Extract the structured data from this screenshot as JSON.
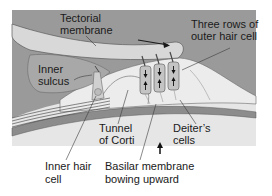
{
  "figure": {
    "colors": {
      "background_field": "#9a9a9a",
      "tectorial_membrane": "#d8d8d8",
      "inner_sulcus": "#a8a8a8",
      "organ_tissue": "#e6e6e6",
      "basilar_membrane": "#8c8c8c",
      "hair_cell": "#c4c4c4",
      "outline": "#5a5a5a",
      "page": "#ffffff",
      "text": "#1a1a1a"
    }
  },
  "labels": {
    "tectorial_membrane": [
      "Tectorial",
      "membrane"
    ],
    "inner_sulcus": [
      "Inner",
      "sulcus"
    ],
    "outer_hair_cells": [
      "Three rows of",
      "outer hair cell"
    ],
    "tunnel_of_corti": [
      "Tunnel",
      "of Corti"
    ],
    "deiters_cells": [
      "Deiter’s",
      "cells"
    ],
    "inner_hair_cell": [
      "Inner hair",
      "cell"
    ],
    "basilar_membrane": [
      "Basilar membrane",
      "bowing upward"
    ]
  },
  "arrows": {
    "tectorial_shear": "right-arrow",
    "basilar_direction": "up-arrow",
    "hair_cell_movement": "up-down-arrows"
  }
}
